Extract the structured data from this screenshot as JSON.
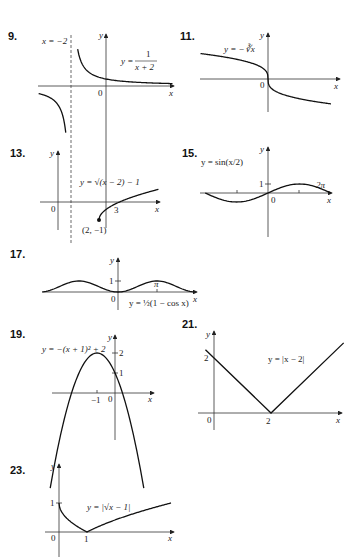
{
  "chart_data": [
    {
      "type": "line",
      "number": "9.",
      "equation": "y = 1/(x + 2)",
      "eq_parts": {
        "lhs": "y =",
        "num": "1",
        "den": "x + 2"
      },
      "asymptote_label": "x = −2",
      "axis_labels": {
        "x": "x",
        "y": "y",
        "origin": "0"
      },
      "xlim": [
        -3.5,
        4
      ],
      "ylim": [
        -5,
        3.5
      ],
      "asymptote_x": -2
    },
    {
      "type": "line",
      "number": "11.",
      "equation": "y = −∛x",
      "axis_labels": {
        "x": "x",
        "y": "y",
        "origin": "0"
      },
      "xlim": [
        -8,
        8
      ],
      "ylim": [
        -3,
        3
      ]
    },
    {
      "type": "line",
      "number": "13.",
      "equation": "y = √(x − 2) − 1",
      "point_label": "(2, −1)",
      "ticks": {
        "x": [
          "3"
        ]
      },
      "axis_labels": {
        "x": "x",
        "y": "y",
        "origin": "0"
      },
      "xlim": [
        0,
        7
      ],
      "ylim": [
        -1.5,
        2
      ]
    },
    {
      "type": "line",
      "number": "15.",
      "equation": "y = sin(x/2)",
      "ticks": {
        "x": [
          "2π"
        ],
        "y": [
          "1"
        ]
      },
      "axis_labels": {
        "x": "x",
        "y": "y",
        "origin": "0"
      },
      "xlim": [
        -6.28,
        6.28
      ],
      "ylim": [
        -2,
        2.5
      ]
    },
    {
      "type": "line",
      "number": "17.",
      "equation": "y = ½(1 − cos x)",
      "ticks": {
        "x": [
          "π"
        ],
        "y": [
          "1"
        ]
      },
      "axis_labels": {
        "x": "x",
        "y": "y",
        "origin": "0"
      },
      "xlim": [
        -6.28,
        6.28
      ],
      "ylim": [
        -0.5,
        1.5
      ]
    },
    {
      "type": "line",
      "number": "19.",
      "equation": "y = −(x + 1)² + 2",
      "ticks": {
        "x": [
          "−1"
        ],
        "y": [
          "1",
          "2"
        ]
      },
      "axis_labels": {
        "x": "x",
        "y": "y",
        "origin": "0"
      },
      "xlim": [
        -4,
        2
      ],
      "ylim": [
        -7,
        3
      ]
    },
    {
      "type": "line",
      "number": "21.",
      "equation": "y = |x − 2|",
      "ticks": {
        "x": [
          "2"
        ],
        "y": [
          "2"
        ]
      },
      "axis_labels": {
        "x": "x",
        "y": "y",
        "origin": "0"
      },
      "xlim": [
        -0.5,
        5
      ],
      "ylim": [
        0,
        3.5
      ]
    },
    {
      "type": "line",
      "number": "23.",
      "equation": "y = |√x − 1|",
      "ticks": {
        "x": [
          "1"
        ],
        "y": [
          "1"
        ]
      },
      "axis_labels": {
        "x": "x",
        "y": "y",
        "origin": "0"
      },
      "xlim": [
        0,
        4
      ],
      "ylim": [
        0,
        1.3
      ]
    }
  ]
}
